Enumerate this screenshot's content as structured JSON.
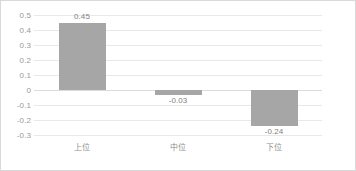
{
  "chart_data": {
    "type": "bar",
    "title": "",
    "subtitle": "",
    "xlabel": "",
    "ylabel": "",
    "categories": [
      "上位",
      "中位",
      "下位"
    ],
    "values": [
      0.45,
      -0.03,
      -0.24
    ],
    "value_labels": [
      "0.45",
      "-0.03",
      "-0.24"
    ],
    "ylim": [
      -0.3,
      0.5
    ],
    "ytick_step": 0.1,
    "yticks": [
      0.5,
      0.4,
      0.3,
      0.2,
      0.1,
      0,
      -0.1,
      -0.2,
      -0.3
    ],
    "ytick_labels": [
      "0.5",
      "0.4",
      "0.3",
      "0.2",
      "0.1",
      "0",
      "-0.1",
      "-0.2",
      "-0.3"
    ],
    "grid": true,
    "legend": false,
    "legend_position": "none",
    "series": [
      {
        "name": "",
        "values": [
          0.45,
          -0.03,
          -0.24
        ]
      }
    ]
  },
  "style": {
    "bar_color": "#a6a6a6",
    "gridline_color": "#e8e8e8",
    "zero_line_color": "#dcdcdc",
    "axis_text_color": "#9a9a9a",
    "value_text_color": "#7f7f7f",
    "category_text_color": "#8c8c8c",
    "border_color": "#d9d9d9",
    "background_color": "#ffffff"
  }
}
